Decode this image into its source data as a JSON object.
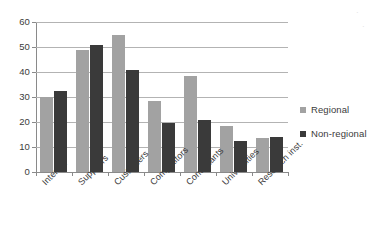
{
  "chart_data": {
    "type": "bar",
    "title": "",
    "xlabel": "",
    "ylabel": "",
    "ylim": [
      0,
      60
    ],
    "yticks": [
      0,
      10,
      20,
      30,
      40,
      50,
      60
    ],
    "grid": true,
    "legend_position": "right",
    "orientation": "vertical",
    "grouping": "grouped",
    "xtick_rotation": -45,
    "categories": [
      "Internal",
      "Suppliers",
      "Customers",
      "Competitors",
      "Consultants",
      "Universities",
      "Research inst."
    ],
    "series": [
      {
        "name": "Regional",
        "color": "#a2a2a2",
        "values": [
          30,
          49,
          55,
          28.5,
          38.5,
          18.5,
          13.5
        ]
      },
      {
        "name": "Non-regional",
        "color": "#3a3a3a",
        "values": [
          32.5,
          51,
          41,
          19.5,
          21,
          12.5,
          14
        ]
      }
    ]
  },
  "legend": {
    "items": [
      {
        "label": "Regional",
        "color": "#a2a2a2"
      },
      {
        "label": "Non-regional",
        "color": "#3a3a3a"
      }
    ]
  },
  "axes": {
    "y_tick_labels": [
      "60",
      "50",
      "40",
      "30",
      "20",
      "10",
      "0"
    ],
    "x_tick_labels": [
      "Internal",
      "Suppliers",
      "Customers",
      "Competitors",
      "Consultants",
      "Universities",
      "Research inst."
    ]
  },
  "colors": {
    "regional": "#a2a2a2",
    "nonregional": "#3a3a3a",
    "gridline": "#b3b3b3",
    "axis": "#8a8a8a",
    "text": "#3b3b3b",
    "background": "#ffffff"
  }
}
